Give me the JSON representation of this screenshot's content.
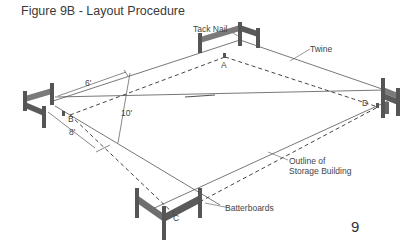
{
  "figure": {
    "title": "Figure 9B - Layout Procedure",
    "page_number": "9"
  },
  "labels": {
    "tack_nail": "Tack Nail",
    "twine": "Twine",
    "outline_line1": "Outline of",
    "outline_line2": "Storage Building",
    "batterboards": "Batterboards"
  },
  "corners": {
    "a": "A",
    "b": "B",
    "c": "C",
    "d": "D"
  },
  "measurements": {
    "six_ft": "6'",
    "eight_ft": "8'",
    "ten_ft": "10'"
  },
  "colors": {
    "line": "#555555",
    "board": "#6e6e6e",
    "board_dark": "#4a4a4a"
  }
}
